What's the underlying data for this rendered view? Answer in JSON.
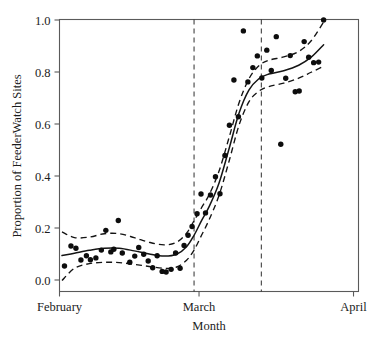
{
  "chart_data": {
    "type": "scatter",
    "title": "",
    "xlabel": "Month",
    "ylabel": "Proportion of FeederWatch Sites",
    "xlim": [
      0,
      60
    ],
    "ylim": [
      0.0,
      1.0
    ],
    "grid": false,
    "legend": null,
    "x_tick_labels": [
      "February",
      "March",
      "April"
    ],
    "x_tick_values": [
      0,
      28,
      59
    ],
    "y_tick_labels": [
      "0.0",
      "0.2",
      "0.4",
      "0.6",
      "0.8",
      "1.0"
    ],
    "y_tick_values": [
      0.0,
      0.2,
      0.4,
      0.6,
      0.8,
      1.0
    ],
    "annotations": [
      {
        "name": "reference-line-1",
        "type": "vline",
        "x": 27.0,
        "style": "dashed"
      },
      {
        "name": "reference-line-2",
        "type": "vline",
        "x": 40.5,
        "style": "dashed"
      }
    ],
    "series": [
      {
        "name": "observed-proportions",
        "type": "scatter",
        "marker": "filled-circle",
        "color": "#0d0d0d",
        "points": [
          [
            1.0,
            0.054
          ],
          [
            2.3,
            0.131
          ],
          [
            3.3,
            0.122
          ],
          [
            4.3,
            0.077
          ],
          [
            5.4,
            0.093
          ],
          [
            6.2,
            0.078
          ],
          [
            7.3,
            0.085
          ],
          [
            8.4,
            0.115
          ],
          [
            9.3,
            0.191
          ],
          [
            10.3,
            0.108
          ],
          [
            10.9,
            0.118
          ],
          [
            11.8,
            0.229
          ],
          [
            12.6,
            0.104
          ],
          [
            14.1,
            0.068
          ],
          [
            15.1,
            0.092
          ],
          [
            15.9,
            0.125
          ],
          [
            16.9,
            0.099
          ],
          [
            17.8,
            0.073
          ],
          [
            18.7,
            0.047
          ],
          [
            19.6,
            0.093
          ],
          [
            20.6,
            0.033
          ],
          [
            21.4,
            0.031
          ],
          [
            22.4,
            0.041
          ],
          [
            23.3,
            0.104
          ],
          [
            24.2,
            0.045
          ],
          [
            25.0,
            0.133
          ],
          [
            25.8,
            0.172
          ],
          [
            26.6,
            0.206
          ],
          [
            27.6,
            0.255
          ],
          [
            28.4,
            0.331
          ],
          [
            29.3,
            0.258
          ],
          [
            30.3,
            0.327
          ],
          [
            31.3,
            0.397
          ],
          [
            32.2,
            0.332
          ],
          [
            33.2,
            0.479
          ],
          [
            34.1,
            0.595
          ],
          [
            35.0,
            0.769
          ],
          [
            35.9,
            0.628
          ],
          [
            36.9,
            0.958
          ],
          [
            37.8,
            0.762
          ],
          [
            38.8,
            0.817
          ],
          [
            39.7,
            0.862
          ],
          [
            40.6,
            0.777
          ],
          [
            41.6,
            0.884
          ],
          [
            42.5,
            0.806
          ],
          [
            43.5,
            0.936
          ],
          [
            44.4,
            0.522
          ],
          [
            45.4,
            0.776
          ],
          [
            46.3,
            0.863
          ],
          [
            47.3,
            0.724
          ],
          [
            48.1,
            0.727
          ],
          [
            49.1,
            0.917
          ],
          [
            50.0,
            0.857
          ],
          [
            51.0,
            0.836
          ],
          [
            52.0,
            0.838
          ],
          [
            53.0,
            1.0
          ]
        ]
      },
      {
        "name": "loess-fit",
        "type": "line",
        "style": "solid",
        "color": "#141414",
        "points": [
          [
            0.5,
            0.094
          ],
          [
            3.0,
            0.103
          ],
          [
            6.0,
            0.114
          ],
          [
            9.0,
            0.122
          ],
          [
            12.0,
            0.122
          ],
          [
            15.0,
            0.112
          ],
          [
            18.0,
            0.1
          ],
          [
            21.0,
            0.092
          ],
          [
            23.5,
            0.099
          ],
          [
            25.5,
            0.128
          ],
          [
            27.0,
            0.172
          ],
          [
            28.5,
            0.228
          ],
          [
            30.0,
            0.281
          ],
          [
            32.0,
            0.372
          ],
          [
            34.0,
            0.503
          ],
          [
            36.0,
            0.64
          ],
          [
            38.0,
            0.73
          ],
          [
            40.0,
            0.774
          ],
          [
            42.0,
            0.792
          ],
          [
            45.0,
            0.805
          ],
          [
            48.0,
            0.826
          ],
          [
            50.5,
            0.857
          ],
          [
            53.0,
            0.905
          ]
        ]
      },
      {
        "name": "confidence-upper",
        "type": "line",
        "style": "dashed",
        "color": "#141414",
        "points": [
          [
            0.5,
            0.185
          ],
          [
            3.0,
            0.163
          ],
          [
            6.0,
            0.165
          ],
          [
            9.0,
            0.178
          ],
          [
            12.0,
            0.178
          ],
          [
            15.0,
            0.163
          ],
          [
            18.0,
            0.145
          ],
          [
            21.0,
            0.135
          ],
          [
            23.5,
            0.145
          ],
          [
            25.5,
            0.18
          ],
          [
            27.0,
            0.228
          ],
          [
            28.5,
            0.278
          ],
          [
            30.0,
            0.327
          ],
          [
            32.0,
            0.418
          ],
          [
            34.0,
            0.546
          ],
          [
            36.0,
            0.68
          ],
          [
            38.0,
            0.773
          ],
          [
            40.0,
            0.824
          ],
          [
            42.0,
            0.845
          ],
          [
            45.0,
            0.858
          ],
          [
            48.0,
            0.879
          ],
          [
            50.5,
            0.92
          ],
          [
            53.0,
            0.992
          ]
        ]
      },
      {
        "name": "confidence-lower",
        "type": "line",
        "style": "dashed",
        "color": "#141414",
        "points": [
          [
            0.5,
            -0.002
          ],
          [
            3.0,
            0.045
          ],
          [
            6.0,
            0.063
          ],
          [
            9.0,
            0.068
          ],
          [
            12.0,
            0.067
          ],
          [
            15.0,
            0.06
          ],
          [
            18.0,
            0.052
          ],
          [
            21.0,
            0.045
          ],
          [
            23.5,
            0.05
          ],
          [
            25.5,
            0.076
          ],
          [
            27.0,
            0.115
          ],
          [
            28.5,
            0.172
          ],
          [
            30.0,
            0.231
          ],
          [
            32.0,
            0.325
          ],
          [
            34.0,
            0.455
          ],
          [
            36.0,
            0.594
          ],
          [
            38.0,
            0.685
          ],
          [
            40.0,
            0.726
          ],
          [
            42.0,
            0.744
          ],
          [
            45.0,
            0.757
          ],
          [
            48.0,
            0.776
          ],
          [
            50.5,
            0.799
          ],
          [
            53.0,
            0.822
          ]
        ]
      }
    ]
  }
}
